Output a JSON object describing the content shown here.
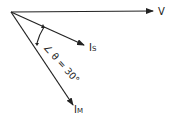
{
  "diagram": {
    "type": "phasor",
    "phasors": [
      {
        "id": "V",
        "label": "V",
        "sub": ""
      },
      {
        "id": "IS",
        "label": "I",
        "sub": "S"
      },
      {
        "id": "IM",
        "label": "I",
        "sub": "M"
      }
    ],
    "angle_annotation": "∠ θ = 30°",
    "color": "#222222"
  }
}
